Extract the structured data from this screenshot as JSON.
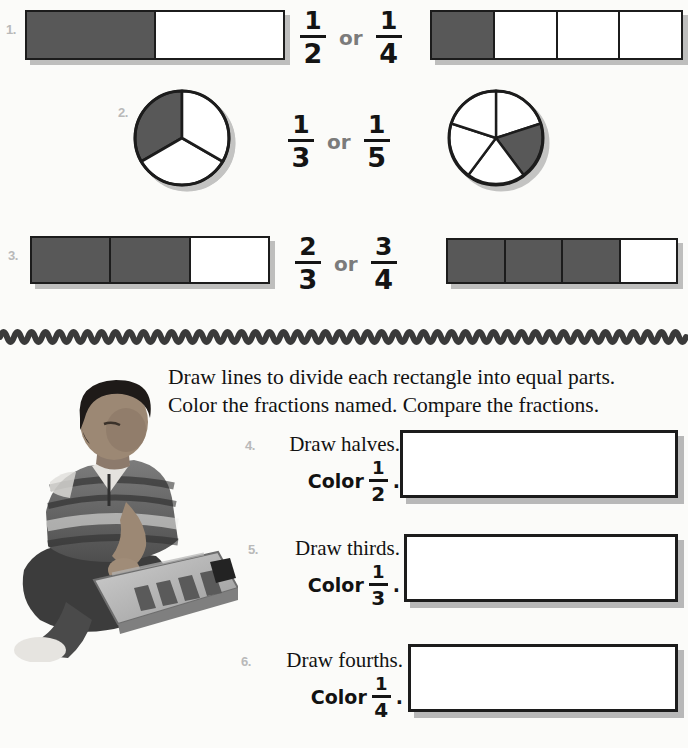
{
  "worksheet": {
    "compare_section": {
      "problems": [
        {
          "number": "1.",
          "left_model": {
            "type": "bar",
            "parts": 2,
            "shaded": 1
          },
          "left_fraction": {
            "numerator": "1",
            "denominator": "2"
          },
          "connector": "or",
          "right_fraction": {
            "numerator": "1",
            "denominator": "4"
          },
          "right_model": {
            "type": "bar",
            "parts": 4,
            "shaded": 1
          }
        },
        {
          "number": "2.",
          "left_model": {
            "type": "circle",
            "parts": 3,
            "shaded": 1
          },
          "left_fraction": {
            "numerator": "1",
            "denominator": "3"
          },
          "connector": "or",
          "right_fraction": {
            "numerator": "1",
            "denominator": "5"
          },
          "right_model": {
            "type": "circle",
            "parts": 5,
            "shaded": 1
          }
        },
        {
          "number": "3.",
          "left_model": {
            "type": "bar",
            "parts": 3,
            "shaded": 2
          },
          "left_fraction": {
            "numerator": "2",
            "denominator": "3"
          },
          "connector": "or",
          "right_fraction": {
            "numerator": "3",
            "denominator": "4"
          },
          "right_model": {
            "type": "bar",
            "parts": 4,
            "shaded": 3
          }
        }
      ]
    },
    "instructions": {
      "line1": "Draw lines to divide each rectangle into equal parts.",
      "line2": "Color the fractions named. Compare the fractions."
    },
    "photo": {
      "caption_alt": "student-with-fraction-board-photo"
    },
    "draw_tasks": [
      {
        "number": "4.",
        "prompt": "Draw halves.",
        "color_word": "Color",
        "fraction": {
          "numerator": "1",
          "denominator": "2"
        },
        "period": ".",
        "answer_value": ""
      },
      {
        "number": "5.",
        "prompt": "Draw thirds.",
        "color_word": "Color",
        "fraction": {
          "numerator": "1",
          "denominator": "3"
        },
        "period": ".",
        "answer_value": ""
      },
      {
        "number": "6.",
        "prompt": "Draw fourths.",
        "color_word": "Color",
        "fraction": {
          "numerator": "1",
          "denominator": "4"
        },
        "period": ".",
        "answer_value": ""
      }
    ],
    "colors": {
      "shade_fill": "#585858",
      "ink": "#1c1c1c",
      "number_gray": "#b9b9b9",
      "or_gray": "#7b7b7b",
      "page_bg": "#fbfbf9"
    }
  }
}
